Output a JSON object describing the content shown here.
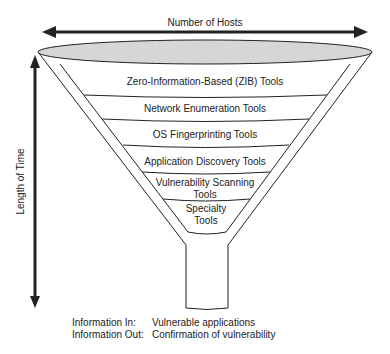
{
  "diagram": {
    "top_axis_label": "Number of Hosts",
    "side_axis_label": "Length of Time",
    "layers": [
      {
        "label": "Zero-Information-Based (ZIB) Tools"
      },
      {
        "label": "Network Enumeration Tools"
      },
      {
        "label": "OS Fingerprinting Tools"
      },
      {
        "label": "Application Discovery Tools"
      },
      {
        "label": "Vulnerability Scanning Tools"
      },
      {
        "label": "Specialty Tools"
      }
    ],
    "info": {
      "in_key": "Information In:",
      "in_value": "Vulnerable applications",
      "out_key": "Information Out:",
      "out_value": "Confirmation of vulnerability"
    },
    "colors": {
      "funnel_top_fill": "#d6d6d6",
      "lines": "#222222"
    }
  }
}
